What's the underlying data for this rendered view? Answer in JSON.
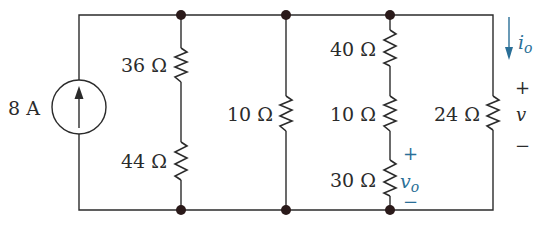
{
  "diagram": {
    "type": "circuit",
    "accent_color": "#2a6f97",
    "wire_color": "#2b2b2b",
    "source": {
      "label": "8 A",
      "kind": "current-source",
      "direction": "up"
    },
    "resistors": [
      {
        "id": "R1",
        "label": "36 Ω",
        "branch": 1
      },
      {
        "id": "R2",
        "label": "44 Ω",
        "branch": 1
      },
      {
        "id": "R3",
        "label": "10 Ω",
        "branch": 2
      },
      {
        "id": "R4",
        "label": "40 Ω",
        "branch": 3
      },
      {
        "id": "R5",
        "label": "10 Ω",
        "branch": 3
      },
      {
        "id": "R6",
        "label": "30 Ω",
        "branch": 3
      },
      {
        "id": "R7",
        "label": "24 Ω",
        "branch": 4
      }
    ],
    "annotations": {
      "io": {
        "label": "i",
        "subscript": "o"
      },
      "v": {
        "plus": "+",
        "label": "v",
        "minus": "−"
      },
      "vo": {
        "plus": "+",
        "label": "v",
        "subscript": "o",
        "minus": "−"
      }
    }
  }
}
